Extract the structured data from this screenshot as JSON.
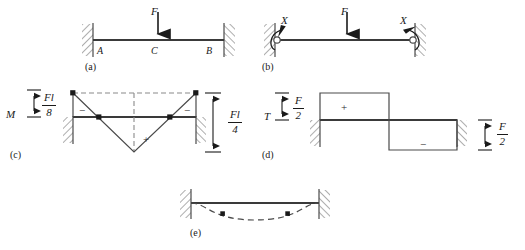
{
  "figure": {
    "accent_color": "#1a1a1a",
    "beam_color": "#3a3a3a",
    "diagram_line_color": "#4a4a4a",
    "dashed_color": "#8a8a8a",
    "background": "#ffffff"
  },
  "panels": [
    {
      "id": "a",
      "tag": "(a)",
      "caption_x": 85,
      "caption_y": 64,
      "description": "Fixed-fixed beam AB with central load F at C",
      "labels": [
        {
          "name": "load-label-f",
          "text": "F",
          "x": 151,
          "y": 6
        },
        {
          "name": "support-label-a",
          "text": "A",
          "x": 97,
          "y": 48
        },
        {
          "name": "midpoint-label-c",
          "text": "C",
          "x": 151,
          "y": 48
        },
        {
          "name": "support-label-b",
          "text": "B",
          "x": 206,
          "y": 48
        }
      ]
    },
    {
      "id": "b",
      "tag": "(b)",
      "caption_x": 262,
      "caption_y": 64,
      "description": "Released primary system: pinned ends with redundant end moments X",
      "labels": [
        {
          "name": "redundant-moment-left",
          "text": "X",
          "x": 281,
          "y": 16
        },
        {
          "name": "load-label-f",
          "text": "F",
          "x": 341,
          "y": 6
        },
        {
          "name": "redundant-moment-right",
          "text": "X",
          "x": 400,
          "y": 16
        }
      ]
    },
    {
      "id": "c",
      "tag": "(c)",
      "caption_x": 10,
      "caption_y": 152,
      "description": "Bending moment diagram M with end moments Fl/8 and mid span ordinate Fl/4",
      "labels": [
        {
          "name": "moment-symbol",
          "text": "M",
          "x": 6,
          "y": 112
        }
      ],
      "fractions": [
        {
          "name": "moment-end-value",
          "numerator": "Fl",
          "denominator": "8",
          "x": 38,
          "y": 93
        },
        {
          "name": "moment-mid-value",
          "numerator": "Fl",
          "denominator": "4",
          "x": 228,
          "y": 110
        }
      ],
      "signs": [
        {
          "name": "sign-negative-left",
          "text": "−",
          "x": 79,
          "y": 110
        },
        {
          "name": "sign-positive-mid",
          "text": "+",
          "x": 143,
          "y": 138
        },
        {
          "name": "sign-negative-right",
          "text": "−",
          "x": 184,
          "y": 110
        }
      ]
    },
    {
      "id": "d",
      "tag": "(d)",
      "caption_x": 262,
      "caption_y": 152,
      "description": "Shear force diagram T with constant ordinates F/2",
      "labels": [
        {
          "name": "shear-symbol",
          "text": "T",
          "x": 264,
          "y": 114
        }
      ],
      "fractions": [
        {
          "name": "shear-left-value",
          "numerator": "F",
          "denominator": "2",
          "x": 292,
          "y": 96
        },
        {
          "name": "shear-right-value",
          "numerator": "F",
          "denominator": "2",
          "x": 497,
          "y": 122
        }
      ],
      "signs": [
        {
          "name": "sign-positive-left",
          "text": "+",
          "x": 341,
          "y": 106
        },
        {
          "name": "sign-negative-right",
          "text": "−",
          "x": 420,
          "y": 143
        }
      ]
    },
    {
      "id": "e",
      "tag": "(e)",
      "caption_x": 190,
      "caption_y": 232,
      "description": "Deflected shape of the beam with two inflection points",
      "labels": []
    }
  ],
  "symbols": {
    "fixed_support": "hatched-wall",
    "pin_support": "circle-hinge",
    "point_load": "down-arrow",
    "moment": "curved-arrow",
    "dimension": "double-headed-arrow",
    "inflection_point": "filled-dot"
  }
}
